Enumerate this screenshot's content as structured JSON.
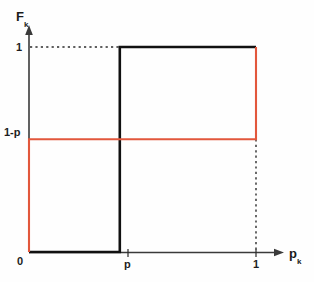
{
  "figure": {
    "width": 314,
    "height": 282,
    "background_color": "#fefefe"
  },
  "axes": {
    "y_label": "F",
    "y_label_subscript": "k",
    "x_label": "p",
    "x_label_subscript": "k",
    "origin_label": "0",
    "y_ticks": [
      {
        "label": "1",
        "value": 1
      },
      {
        "label": "1-p",
        "value": 0.55
      }
    ],
    "x_ticks": [
      {
        "label": "p",
        "value": 0.4
      },
      {
        "label": "1",
        "value": 1
      }
    ],
    "axis_color": "#3a3a3a"
  },
  "colors": {
    "black_curve": "#111111",
    "red_curve": "#e2573c",
    "dotted": "#2b2b2b",
    "axis": "#3a3a3a"
  },
  "chart_data": {
    "type": "line",
    "title": "",
    "xlabel": "p_k",
    "ylabel": "F_k",
    "xlim": [
      0,
      1.12
    ],
    "ylim": [
      0,
      1.12
    ],
    "grid": false,
    "legend": "none",
    "x_tick_values": [
      0,
      0.4,
      1
    ],
    "x_tick_labels": [
      "0",
      "p",
      "1"
    ],
    "y_tick_values": [
      0,
      0.55,
      1
    ],
    "y_tick_labels": [
      "0",
      "1-p",
      "1"
    ],
    "series": [
      {
        "name": "black-step",
        "color": "#111111",
        "style": "step",
        "x": [
          0,
          0.4,
          0.4,
          1
        ],
        "y": [
          0,
          0,
          1,
          1
        ],
        "description": "Step function jumping from 0 to 1 at p_k = p"
      },
      {
        "name": "red-step",
        "color": "#e2573c",
        "style": "step",
        "x": [
          0,
          0,
          1,
          1
        ],
        "y": [
          0,
          0.55,
          0.55,
          1
        ],
        "description": "Step function rising to 1-p at 0 and to 1 at p_k = 1"
      }
    ],
    "annotations": [
      {
        "name": "dotted-horizontal-to-one",
        "style": "dotted",
        "from": [
          0,
          1
        ],
        "to": [
          0.4,
          1
        ]
      },
      {
        "name": "dotted-vertical-at-one",
        "style": "dotted",
        "from": [
          1,
          0.55
        ],
        "to": [
          1,
          0
        ]
      }
    ]
  }
}
